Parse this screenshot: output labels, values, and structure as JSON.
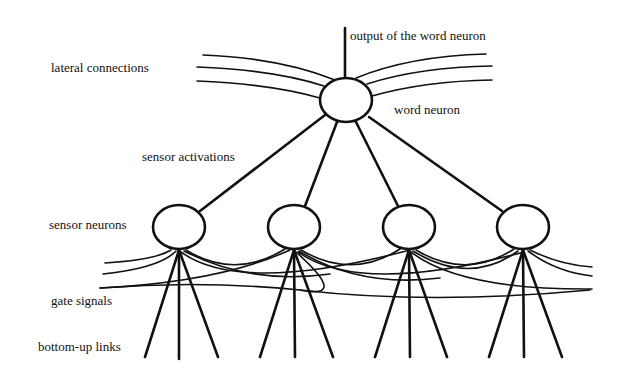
{
  "diagram": {
    "labels": {
      "output": "output of the word neuron",
      "lateral": "lateral connections",
      "word_neuron": "word neuron",
      "sensor_activations": "sensor activations",
      "sensor_neurons": "sensor neurons",
      "gate_signals": "gate signals",
      "bottom_up": "bottom-up links"
    },
    "nodes": {
      "word_neuron": {
        "cx": 346,
        "cy": 100,
        "rx": 26,
        "ry": 22
      },
      "sensor_neurons": [
        {
          "cx": 179,
          "cy": 227
        },
        {
          "cx": 294,
          "cy": 227
        },
        {
          "cx": 409,
          "cy": 227
        },
        {
          "cx": 523,
          "cy": 227
        }
      ]
    },
    "colors": {
      "ink": "#111111",
      "background": "#ffffff"
    }
  }
}
